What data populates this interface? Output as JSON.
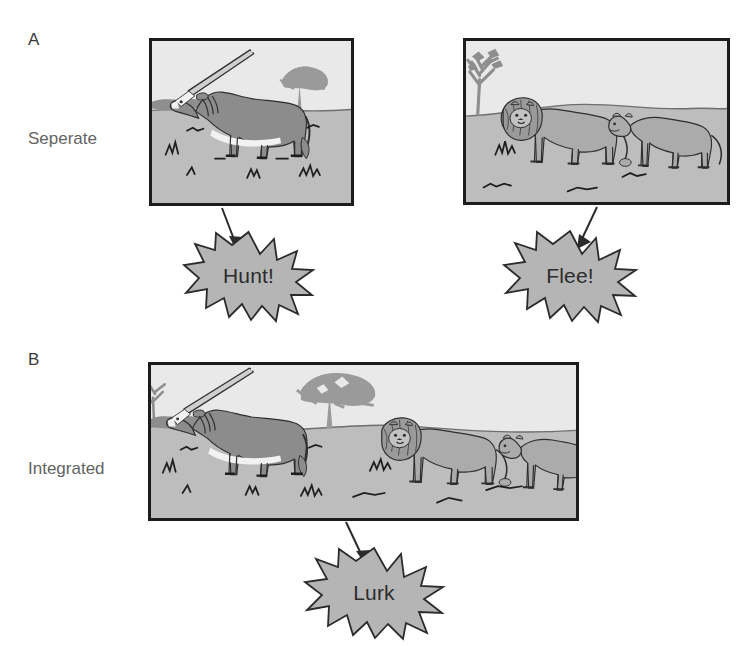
{
  "figure": {
    "domain": "Diagram",
    "width": 755,
    "height": 646,
    "background": "#ffffff"
  },
  "palette": {
    "panel_border": "#1c1c1c",
    "sky": "#e9e9e9",
    "ground": "#bdbdbd",
    "burst_fill": "#b5b5b5",
    "burst_stroke": "#2b2b2b",
    "arrow": "#2b2b2b",
    "label_text": "#636363",
    "letter_text": "#3a3a3a",
    "animal_dark": "#8c8c8c",
    "animal_light": "#b0b0b0",
    "outline": "#2e2e2e",
    "tree": "#9a9a9a",
    "grass": "#1e1e1e"
  },
  "panels": [
    {
      "id": "A",
      "letter": "A",
      "row_label": "Seperate",
      "scenes": [
        {
          "id": "scene-prey",
          "name": "oryx-scene",
          "animals": [
            "oryx"
          ],
          "features": [
            "horizon",
            "acacia-tree",
            "grass-tufts"
          ],
          "callout": "Hunt!"
        },
        {
          "id": "scene-predators",
          "name": "lions-scene",
          "animals": [
            "male-lion",
            "lioness"
          ],
          "features": [
            "horizon",
            "bare-tree",
            "grass-tufts"
          ],
          "callout": "Flee!"
        }
      ]
    },
    {
      "id": "B",
      "letter": "B",
      "row_label": "Integrated",
      "scenes": [
        {
          "id": "scene-integrated",
          "name": "integrated-scene",
          "animals": [
            "oryx",
            "male-lion",
            "lioness"
          ],
          "features": [
            "horizon",
            "acacia-tree",
            "bare-tree",
            "grass-tufts"
          ],
          "callout": "Lurk"
        }
      ]
    }
  ],
  "callouts": [
    {
      "id": "callout-hunt",
      "label": "Hunt!",
      "points": 15
    },
    {
      "id": "callout-flee",
      "label": "Flee!",
      "points": 15
    },
    {
      "id": "callout-lurk",
      "label": "Lurk",
      "points": 15
    }
  ]
}
